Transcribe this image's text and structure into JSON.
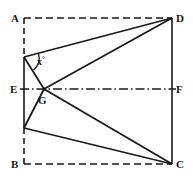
{
  "figure": {
    "stroke_color": "#1a1a1a",
    "background_color": "#ffffff",
    "labels": {
      "A": "A",
      "B": "B",
      "C": "C",
      "D": "D",
      "E": "E",
      "F": "F",
      "G": "G",
      "angle_x": "x",
      "angle_degree_symbol": "°"
    },
    "points": {
      "A": {
        "x": 24,
        "y": 18
      },
      "B": {
        "x": 24,
        "y": 164
      },
      "C": {
        "x": 172,
        "y": 164
      },
      "D": {
        "x": 172,
        "y": 18
      },
      "E": {
        "x": 24,
        "y": 89
      },
      "F": {
        "x": 172,
        "y": 89
      },
      "G": {
        "x": 44,
        "y": 89
      },
      "P": {
        "x": 24,
        "y": 57
      },
      "Q": {
        "x": 24,
        "y": 128
      }
    },
    "segments": [
      {
        "name": "A-to-D-top",
        "from": "A",
        "to": "D",
        "style": "dashed"
      },
      {
        "name": "B-to-C-bottom",
        "from": "B",
        "to": "C",
        "style": "dashed"
      },
      {
        "name": "A-to-P-left-upper",
        "from": "A",
        "to": "P",
        "style": "dashed"
      },
      {
        "name": "Q-to-B-left-lower",
        "from": "Q",
        "to": "B",
        "style": "dashed"
      },
      {
        "name": "P-to-Q-left-middle",
        "from": "P",
        "to": "Q",
        "style": "solid"
      },
      {
        "name": "D-to-C-right",
        "from": "D",
        "to": "C",
        "style": "solid"
      },
      {
        "name": "E-to-F-centerline",
        "from": "E",
        "to": "F",
        "style": "dash-dot"
      },
      {
        "name": "P-to-D-diagonal",
        "from": "P",
        "to": "D",
        "style": "solid"
      },
      {
        "name": "G-to-D-diagonal",
        "from": "G",
        "to": "D",
        "style": "solid"
      },
      {
        "name": "G-to-C-diagonal",
        "from": "G",
        "to": "C",
        "style": "solid"
      },
      {
        "name": "Q-to-C-diagonal",
        "from": "Q",
        "to": "C",
        "style": "solid"
      },
      {
        "name": "P-to-G-segment",
        "from": "P",
        "to": "G",
        "style": "solid"
      },
      {
        "name": "G-to-Q-segment",
        "from": "G",
        "to": "Q",
        "style": "solid"
      }
    ],
    "angle_arc": {
      "name": "angle-x-at-P",
      "vertex": "P",
      "value_text": "x"
    }
  }
}
